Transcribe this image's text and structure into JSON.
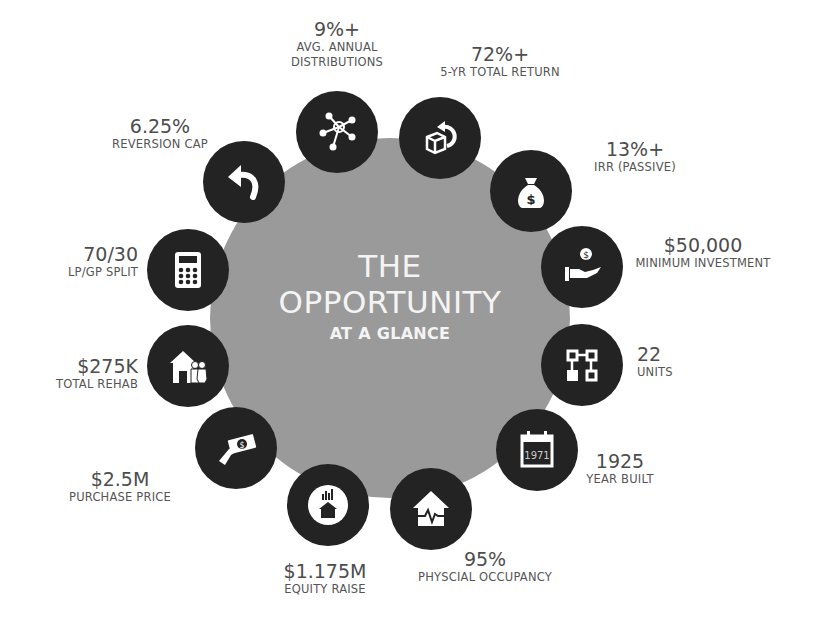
{
  "title": {
    "line1": "THE",
    "line2": "OPPORTUNITY",
    "line3": "AT A GLANCE"
  },
  "colors": {
    "center_circle": "#9a9a9a",
    "icon_bg": "#232323",
    "text": "#4d4d4d",
    "title_text": "#f4f4f4"
  },
  "metrics": [
    {
      "value": "9%+",
      "caption_line1": "AVG. ANNUAL",
      "caption_line2": "DISTRIBUTIONS",
      "icon": "network-hub-icon"
    },
    {
      "value": "72%+",
      "caption_line1": "5-YR TOTAL RETURN",
      "icon": "box-return-icon"
    },
    {
      "value": "13%+",
      "caption_line1": "IRR (PASSIVE)",
      "icon": "money-bag-icon"
    },
    {
      "value": "$50,000",
      "caption_line1": "MINIMUM INVESTMENT",
      "icon": "hand-coin-icon"
    },
    {
      "value": "22",
      "caption_line1": "UNITS",
      "icon": "unit-blocks-icon"
    },
    {
      "value": "1925",
      "caption_line1": "YEAR BUILT",
      "icon": "calendar-icon",
      "icon_text": "1971"
    },
    {
      "value": "95%",
      "caption_line1": "PHYSCIAL OCCUPANCY",
      "icon": "house-heartbeat-icon"
    },
    {
      "value": "$1.175M",
      "caption_line1": "EQUITY RAISE",
      "icon": "house-growth-icon"
    },
    {
      "value": "$2.5M",
      "caption_line1": "PURCHASE PRICE",
      "icon": "hand-cash-icon"
    },
    {
      "value": "$275K",
      "caption_line1": "TOTAL REHAB",
      "icon": "house-family-icon"
    },
    {
      "value": "70/30",
      "caption_line1": "LP/GP SPLIT",
      "icon": "calculator-icon"
    },
    {
      "value": "6.25%",
      "caption_line1": "REVERSION CAP",
      "icon": "undo-arrow-icon"
    }
  ]
}
